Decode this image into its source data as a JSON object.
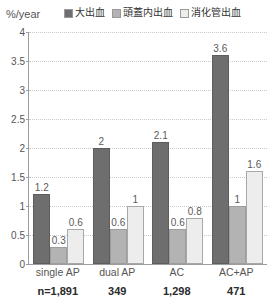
{
  "axis": {
    "unit_label": "%/year"
  },
  "legend": {
    "items": [
      {
        "label": "大出血",
        "color": "#6e6e6e",
        "swatch_name": "legend-swatch-major-bleeding"
      },
      {
        "label": "頭蓋内出血",
        "color": "#b3b3b3",
        "swatch_name": "legend-swatch-intracranial-bleeding"
      },
      {
        "label": "消化管出血",
        "color": "#ededed",
        "swatch_name": "legend-swatch-gastrointestinal-bleeding"
      }
    ]
  },
  "yticks": [
    "0",
    "0.5",
    "1",
    "1.5",
    "2",
    "2.5",
    "3",
    "3.5",
    "4"
  ],
  "sample_sizes": [
    "n=1,891",
    "349",
    "1,298",
    "471"
  ],
  "chart_data": {
    "type": "bar",
    "title": "",
    "xlabel": "",
    "ylabel": "%/year",
    "ylim": [
      0,
      4
    ],
    "ytick_step": 0.5,
    "grid": true,
    "legend_position": "top",
    "categories": [
      "single AP",
      "dual AP",
      "AC",
      "AC+AP"
    ],
    "series": [
      {
        "name": "大出血",
        "color": "#6e6e6e",
        "values": [
          1.2,
          2,
          2.1,
          3.6
        ],
        "labels": [
          "1.2",
          "2",
          "2.1",
          "3.6"
        ]
      },
      {
        "name": "頭蓋内出血",
        "color": "#b3b3b3",
        "values": [
          0.3,
          0.6,
          0.6,
          1
        ],
        "labels": [
          "0.3",
          "0.6",
          "0.6",
          "1"
        ]
      },
      {
        "name": "消化管出血",
        "color": "#ededed",
        "values": [
          0.6,
          1,
          0.8,
          1.6
        ],
        "labels": [
          "0.6",
          "1",
          "0.8",
          "1.6"
        ]
      }
    ],
    "annotations": {
      "sample_sizes": [
        "n=1,891",
        "349",
        "1,298",
        "471"
      ]
    }
  }
}
